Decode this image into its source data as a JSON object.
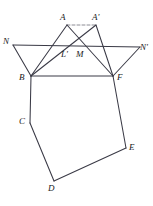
{
  "figure": {
    "type": "geometry-diagram",
    "background": "#ffffff",
    "stroke_color": "#3a3a46",
    "dashed_color": "#6e6e7a",
    "label_color": "#1a1a1a",
    "width": 153,
    "height": 206
  },
  "points": {
    "A": {
      "label": "A",
      "x": 67,
      "y": 25,
      "label_x": 60,
      "label_y": 13
    },
    "Ap": {
      "label": "A'",
      "x": 96,
      "y": 25,
      "label_x": 92,
      "label_y": 13
    },
    "N": {
      "label": "N",
      "x": 13,
      "y": 45,
      "label_x": 3,
      "label_y": 37
    },
    "Np": {
      "label": "N'",
      "x": 140,
      "y": 47,
      "label_x": 140,
      "label_y": 43
    },
    "Lp": {
      "label": "L'",
      "x": 68,
      "y": 50,
      "label_x": 61,
      "label_y": 50
    },
    "M": {
      "label": "M",
      "x": 80,
      "y": 50,
      "label_x": 76,
      "label_y": 50
    },
    "B": {
      "label": "B",
      "x": 31,
      "y": 76,
      "label_x": 19,
      "label_y": 73
    },
    "F": {
      "label": "F",
      "x": 113,
      "y": 76,
      "label_x": 117,
      "label_y": 73
    },
    "C": {
      "label": "C",
      "x": 30,
      "y": 123,
      "label_x": 19,
      "label_y": 117
    },
    "D": {
      "label": "D",
      "x": 54,
      "y": 181,
      "label_x": 48,
      "label_y": 184
    },
    "E": {
      "label": "E",
      "x": 126,
      "y": 148,
      "label_x": 129,
      "label_y": 143
    }
  },
  "segments": [
    {
      "name": "seg-A-Ap-dashed",
      "from": "A",
      "to": "Ap",
      "dashed": true
    },
    {
      "name": "seg-A-B",
      "from": "A",
      "to": "B",
      "dashed": false
    },
    {
      "name": "seg-A-F",
      "from": "A",
      "to": "F",
      "dashed": false
    },
    {
      "name": "seg-Ap-B",
      "from": "Ap",
      "to": "B",
      "dashed": false
    },
    {
      "name": "seg-Ap-F",
      "from": "Ap",
      "to": "F",
      "dashed": false
    },
    {
      "name": "seg-N-Np",
      "from": "N",
      "to": "Np",
      "dashed": false
    },
    {
      "name": "seg-N-B",
      "from": "N",
      "to": "B",
      "dashed": false
    },
    {
      "name": "seg-Np-F",
      "from": "Np",
      "to": "F",
      "dashed": false
    },
    {
      "name": "seg-B-F",
      "from": "B",
      "to": "F",
      "dashed": false
    },
    {
      "name": "seg-B-C",
      "from": "B",
      "to": "C",
      "dashed": false
    },
    {
      "name": "seg-C-D",
      "from": "C",
      "to": "D",
      "dashed": false
    },
    {
      "name": "seg-D-E",
      "from": "D",
      "to": "E",
      "dashed": false
    },
    {
      "name": "seg-E-F",
      "from": "E",
      "to": "F",
      "dashed": false
    }
  ],
  "labels_order": [
    "A",
    "Ap",
    "N",
    "Np",
    "Lp",
    "M",
    "B",
    "F",
    "C",
    "D",
    "E"
  ]
}
